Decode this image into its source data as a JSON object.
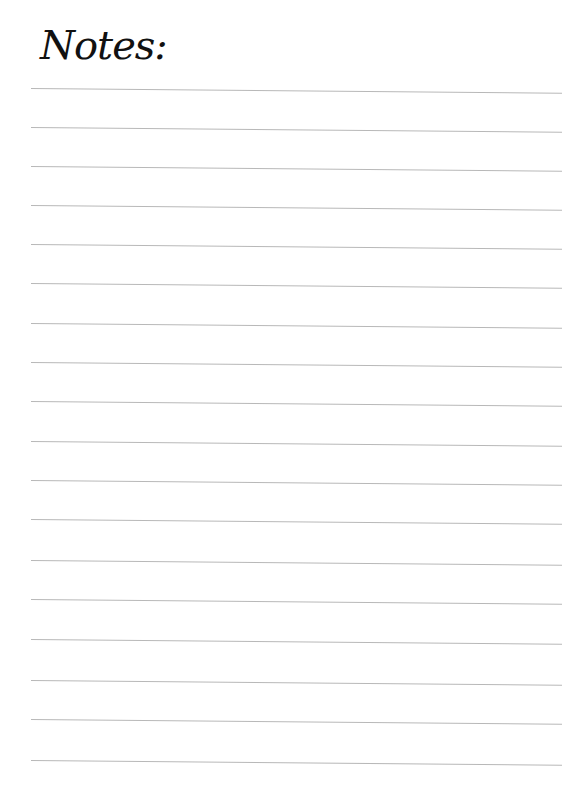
{
  "page": {
    "title": "Notes:",
    "line_count": 18,
    "line_positions": [
      88,
      127,
      166,
      205,
      244,
      283,
      323,
      362,
      401,
      441,
      480,
      519,
      560,
      599,
      639,
      680,
      719,
      760
    ],
    "line_color": "#b8b8b8"
  }
}
